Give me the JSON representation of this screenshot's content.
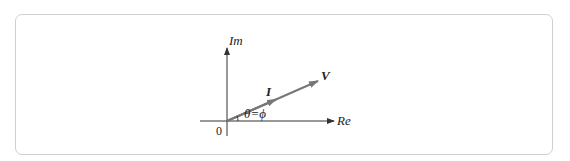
{
  "diagram": {
    "type": "phasor",
    "axes": {
      "vertical_label": "Im",
      "horizontal_label": "Re",
      "origin_label": "0"
    },
    "vectors": [
      {
        "name": "V",
        "label": "V"
      },
      {
        "name": "I",
        "label": "I"
      }
    ],
    "angle_label": "θ=ϕ",
    "colors": {
      "axis": "#333333",
      "vector": "#777777",
      "frame": "#cfcfcf"
    }
  }
}
